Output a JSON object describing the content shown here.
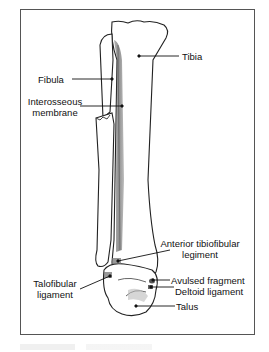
{
  "figure": {
    "type": "anatomical-illustration",
    "border_color": "#555555",
    "labels": {
      "tibia": "Tibia",
      "fibula": "Fibula",
      "interosseous_line1": "Interosseous",
      "interosseous_line2": "membrane",
      "anterior_tibiofibular_line1": "Anterior tibiofibular",
      "anterior_tibiofibular_line2": "legiment",
      "talofibular_line1": "Talofibular",
      "talofibular_line2": "ligament",
      "avulsed_fragment": "Avulsed fragment",
      "deltoid_ligament": "Deltoid ligament",
      "talus": "Talus"
    }
  }
}
